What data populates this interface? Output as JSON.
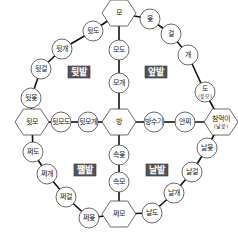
{
  "diagram": {
    "type": "yut-board",
    "zones": [
      {
        "id": "top-left",
        "label": "뒷밭"
      },
      {
        "id": "top-right",
        "label": "앞밭"
      },
      {
        "id": "bottom-left",
        "label": "쨀밭"
      },
      {
        "id": "bottom-right",
        "label": "날밭"
      }
    ],
    "nodes": [
      {
        "id": "mo",
        "label": "모",
        "shape": "hex"
      },
      {
        "id": "yut",
        "label": "윷",
        "shape": "circle"
      },
      {
        "id": "geol",
        "label": "걸",
        "shape": "circle"
      },
      {
        "id": "gae",
        "label": "개",
        "shape": "circle"
      },
      {
        "id": "do",
        "label": "도",
        "sub": "(윷모)",
        "shape": "circle"
      },
      {
        "id": "chammeogi",
        "label": "참먹이",
        "sub": "(날윷)",
        "shape": "hex"
      },
      {
        "id": "nalyut",
        "label": "날윷",
        "shape": "circle"
      },
      {
        "id": "nalgeol",
        "label": "날걸",
        "shape": "circle"
      },
      {
        "id": "nalgae",
        "label": "날개",
        "shape": "circle"
      },
      {
        "id": "naldo",
        "label": "날도",
        "shape": "circle"
      },
      {
        "id": "jjeomo",
        "label": "쩌모",
        "shape": "hex"
      },
      {
        "id": "jjeoyut",
        "label": "쩌윷",
        "shape": "circle"
      },
      {
        "id": "jjeogeol",
        "label": "쩌걸",
        "shape": "circle"
      },
      {
        "id": "jjeogae",
        "label": "쩌개",
        "shape": "circle"
      },
      {
        "id": "jjeodo",
        "label": "쩌도",
        "shape": "circle"
      },
      {
        "id": "dwitmo",
        "label": "뒷모",
        "shape": "hex"
      },
      {
        "id": "dwityut",
        "label": "뒷윷",
        "shape": "circle"
      },
      {
        "id": "dwitgeol",
        "label": "뒷걸",
        "shape": "circle"
      },
      {
        "id": "dwitgae",
        "label": "뒷개",
        "shape": "circle"
      },
      {
        "id": "dwitdo",
        "label": "뒷도",
        "shape": "circle"
      },
      {
        "id": "modo",
        "label": "모도",
        "shape": "circle"
      },
      {
        "id": "mogae",
        "label": "모개",
        "shape": "circle"
      },
      {
        "id": "bang",
        "label": "방",
        "shape": "hex"
      },
      {
        "id": "sokyut",
        "label": "속윷",
        "shape": "circle"
      },
      {
        "id": "sokmo",
        "label": "속모",
        "shape": "circle"
      },
      {
        "id": "dwitmodo",
        "label": "뒷모도",
        "shape": "circle"
      },
      {
        "id": "dwitmogae",
        "label": "뒷모개",
        "shape": "circle"
      },
      {
        "id": "bangsugi",
        "label": "방수기",
        "shape": "circle"
      },
      {
        "id": "anjji",
        "label": "안찌",
        "shape": "circle"
      }
    ],
    "edges": [
      [
        "mo",
        "yut"
      ],
      [
        "yut",
        "geol"
      ],
      [
        "geol",
        "gae"
      ],
      [
        "gae",
        "do"
      ],
      [
        "do",
        "chammeogi"
      ],
      [
        "chammeogi",
        "nalyut"
      ],
      [
        "nalyut",
        "nalgeol"
      ],
      [
        "nalgeol",
        "nalgae"
      ],
      [
        "nalgae",
        "naldo"
      ],
      [
        "naldo",
        "jjeomo"
      ],
      [
        "jjeomo",
        "jjeoyut"
      ],
      [
        "jjeoyut",
        "jjeogeol"
      ],
      [
        "jjeogeol",
        "jjeogae"
      ],
      [
        "jjeogae",
        "jjeodo"
      ],
      [
        "jjeodo",
        "dwitmo"
      ],
      [
        "dwitmo",
        "dwityut"
      ],
      [
        "dwityut",
        "dwitgeol"
      ],
      [
        "dwitgeol",
        "dwitgae"
      ],
      [
        "dwitgae",
        "dwitdo"
      ],
      [
        "dwitdo",
        "mo"
      ],
      [
        "mo",
        "modo"
      ],
      [
        "modo",
        "mogae"
      ],
      [
        "mogae",
        "bang"
      ],
      [
        "bang",
        "sokyut"
      ],
      [
        "sokyut",
        "sokmo"
      ],
      [
        "sokmo",
        "jjeomo"
      ],
      [
        "dwitmo",
        "dwitmodo"
      ],
      [
        "dwitmodo",
        "dwitmogae"
      ],
      [
        "dwitmogae",
        "bang"
      ],
      [
        "bang",
        "bangsugi"
      ],
      [
        "bangsugi",
        "anjji"
      ],
      [
        "anjji",
        "chammeogi"
      ]
    ]
  }
}
